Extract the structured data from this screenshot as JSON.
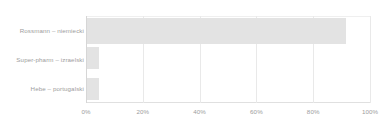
{
  "chart_data": {
    "type": "bar",
    "orientation": "horizontal",
    "title": "",
    "subtitle": "",
    "xlabel": "",
    "ylabel": "",
    "categories": [
      "Rossmann – niemiecki",
      "Super-pharm – izraelski",
      "Hebe – portugalski"
    ],
    "values": [
      91,
      4.2,
      4.2
    ],
    "value_suffix": "%",
    "xlim": [
      0,
      100
    ],
    "xticks": [
      0,
      20,
      40,
      60,
      80,
      100
    ],
    "xtick_labels": [
      "0%",
      "20%",
      "40%",
      "60%",
      "80%",
      "100%"
    ],
    "grid": true,
    "grid_axis": "x",
    "legend": false,
    "legend_position": "none",
    "series": [
      {
        "name": "",
        "values": [
          91,
          4.2,
          4.2
        ]
      }
    ],
    "annotations": []
  },
  "style": {
    "bar_color": "#e3e3e3",
    "grid_color": "#e9e9e9",
    "axis_color": "#d6d6d6",
    "text_color": "#9d9d9d",
    "background": "#ffffff"
  }
}
